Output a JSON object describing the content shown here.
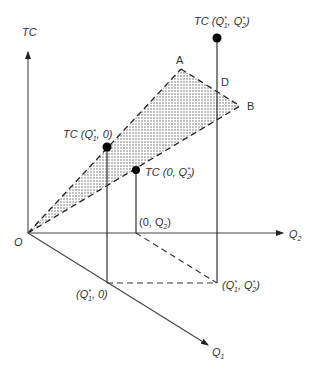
{
  "diagram": {
    "type": "3d-cost-surface",
    "axes": {
      "vertical": {
        "label": "TC"
      },
      "horizontal": {
        "label": "Q",
        "subscript": "2"
      },
      "diagonal": {
        "label": "Q",
        "subscript": "1"
      },
      "origin": {
        "label": "O"
      }
    },
    "points": {
      "tc_q1q2": {
        "prefix": "TC (Q",
        "sub1": "1",
        "mid": ", Q",
        "sub2": "2",
        "suffix": ")"
      },
      "tc_q1_0": {
        "prefix": "TC (Q",
        "sub1": "1",
        "suffix": ", 0)"
      },
      "tc_0_q2": {
        "prefix": "TC (0, Q",
        "sub2": "2",
        "suffix": ")"
      },
      "base_0_q2": {
        "prefix": "(0, Q",
        "sub2": "2",
        "suffix": ")"
      },
      "base_q1_0": {
        "prefix": "(Q",
        "sub1": "1",
        "suffix": ", 0)"
      },
      "base_q1_q2": {
        "prefix": "(Q",
        "sub1": "1",
        "mid": ", Q",
        "sub2": "2",
        "suffix": ")"
      }
    },
    "vertices": {
      "a": "A",
      "b": "B",
      "d": "D"
    },
    "star": "*"
  }
}
